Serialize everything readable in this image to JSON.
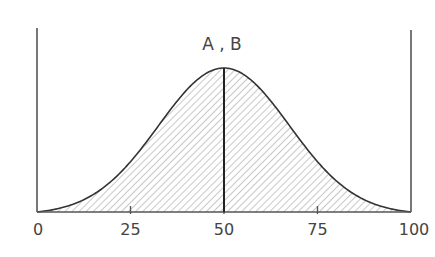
{
  "chart_data": {
    "type": "area",
    "title": "",
    "annotation": "A , B",
    "xlabel": "",
    "ylabel": "",
    "xlim": [
      0,
      100
    ],
    "x_ticks": [
      0,
      25,
      50,
      75,
      100
    ],
    "x_tick_labels": [
      "0",
      "25",
      "50",
      "75",
      "100"
    ],
    "grid": false,
    "legend": null,
    "series": [
      {
        "name": "A , B",
        "distribution": "normal (bell curve)",
        "mean": 50,
        "x": [
          0,
          10,
          20,
          25,
          30,
          40,
          50,
          60,
          70,
          75,
          80,
          90,
          100
        ],
        "relative_y": [
          0.0,
          0.12,
          0.33,
          0.47,
          0.62,
          0.88,
          1.0,
          0.88,
          0.62,
          0.47,
          0.33,
          0.12,
          0.0
        ],
        "fill": "hatched"
      }
    ],
    "vertical_marker": {
      "x": 50,
      "label": "A , B"
    }
  },
  "colors": {
    "axis": "#555555",
    "curve": "#333333",
    "marker": "#222222",
    "hatch": "#9a9a9a",
    "text": "#444444"
  }
}
